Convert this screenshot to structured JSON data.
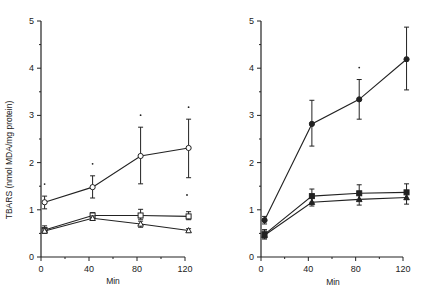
{
  "figure": {
    "ylabel": "TBARS (nmol MDA/mg protein)",
    "xlabel_left": "Min",
    "xlabel_right": "Min",
    "colors": {
      "ink": "#222222",
      "background": "#ffffff"
    }
  },
  "chart_data": [
    {
      "type": "line",
      "panel": "left",
      "title": "",
      "xlabel": "Min",
      "ylabel": "TBARS (nmol MDA/mg protein)",
      "xlim": [
        0,
        120
      ],
      "ylim": [
        0,
        5
      ],
      "xticks": [
        0,
        40,
        80,
        120
      ],
      "yticks": [
        0,
        1,
        2,
        3,
        4,
        5
      ],
      "grid": false,
      "legend": null,
      "x": [
        3,
        43,
        83,
        123
      ],
      "series": [
        {
          "name": "open circle",
          "marker": "open-circle",
          "values": [
            1.16,
            1.48,
            2.14,
            2.31
          ],
          "err_low": [
            1.02,
            1.25,
            1.55,
            1.68
          ],
          "err_high": [
            1.29,
            1.72,
            2.75,
            2.92
          ],
          "annotations": [
            "*",
            "*",
            "*",
            "*"
          ]
        },
        {
          "name": "open square",
          "marker": "open-square",
          "values": [
            0.57,
            0.88,
            0.88,
            0.86
          ],
          "err_low": [
            0.52,
            0.83,
            0.8,
            0.79
          ],
          "err_high": [
            0.66,
            0.94,
            1.01,
            0.96
          ]
        },
        {
          "name": "open triangle",
          "marker": "open-triangle",
          "values": [
            0.55,
            0.82,
            0.7,
            0.56
          ],
          "err_low": [
            0.5,
            0.78,
            0.63,
            0.53
          ],
          "err_high": [
            0.6,
            0.87,
            0.76,
            0.6
          ]
        }
      ]
    },
    {
      "type": "line",
      "panel": "right",
      "title": "",
      "xlabel": "Min",
      "ylabel": "",
      "xlim": [
        0,
        120
      ],
      "ylim": [
        0,
        5
      ],
      "xticks": [
        0,
        40,
        80,
        120
      ],
      "yticks": [
        0,
        1,
        2,
        3,
        4,
        5
      ],
      "grid": false,
      "legend": null,
      "x": [
        3,
        43,
        83,
        123
      ],
      "series": [
        {
          "name": "filled circle",
          "marker": "filled-circle",
          "values": [
            0.78,
            2.82,
            3.34,
            4.19
          ],
          "err_low": [
            0.7,
            2.35,
            2.92,
            3.54
          ],
          "err_high": [
            0.86,
            3.32,
            3.76,
            4.87
          ],
          "annotations": [
            "",
            "",
            "*",
            ""
          ]
        },
        {
          "name": "filled square",
          "marker": "filled-square",
          "values": [
            0.48,
            1.29,
            1.35,
            1.37
          ],
          "err_low": [
            0.4,
            1.16,
            1.2,
            1.22
          ],
          "err_high": [
            0.58,
            1.44,
            1.53,
            1.55
          ]
        },
        {
          "name": "filled triangle",
          "marker": "filled-triangle",
          "values": [
            0.46,
            1.16,
            1.22,
            1.26
          ],
          "err_low": [
            0.38,
            1.08,
            1.1,
            1.12
          ],
          "err_high": [
            0.55,
            1.25,
            1.32,
            1.36
          ]
        }
      ]
    }
  ]
}
